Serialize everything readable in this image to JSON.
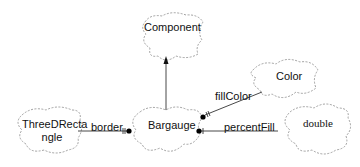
{
  "diagram": {
    "type": "class-diagram",
    "classes": {
      "component": {
        "label": "Component"
      },
      "color": {
        "label": "Color"
      },
      "threeDRectangle": {
        "label_line1": "ThreeDRecta",
        "label_line2": "ngle"
      },
      "bargauge": {
        "label": "Bargauge"
      },
      "double": {
        "label": "double"
      }
    },
    "relations": [
      {
        "from": "Bargauge",
        "to": "Component",
        "kind": "inheritance",
        "label": ""
      },
      {
        "from": "Bargauge",
        "to": "Color",
        "kind": "association",
        "label": "fillColor"
      },
      {
        "from": "Bargauge",
        "to": "ThreeDRectangle",
        "kind": "association",
        "label": "border"
      },
      {
        "from": "Bargauge",
        "to": "double",
        "kind": "association",
        "label": "percentFill"
      }
    ],
    "edge_labels": {
      "fillColor": "fillColor",
      "border": "border",
      "percentFill": "percentFill"
    },
    "colors": {
      "line": "#333333",
      "cloud_border": "#8a8a8a",
      "text": "#111111"
    }
  }
}
